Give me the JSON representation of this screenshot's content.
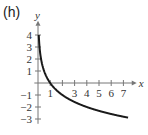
{
  "panel": {
    "label": "(h)"
  },
  "chart_data": {
    "type": "line",
    "title": "",
    "xlabel": "x",
    "ylabel": "y",
    "xlim": [
      0,
      7.6
    ],
    "ylim": [
      -3.4,
      4.6
    ],
    "x_ticks": [
      1,
      2,
      3,
      4,
      5,
      6,
      7
    ],
    "x_tick_labels": [
      "1",
      "",
      "3",
      "4",
      "5",
      "6",
      "7"
    ],
    "y_ticks": [
      -3,
      -2,
      -1,
      1,
      2,
      3,
      4
    ],
    "y_tick_labels": [
      "-3",
      "-2",
      "-1",
      "1",
      "2",
      "3",
      "4"
    ],
    "grid": false,
    "series": [
      {
        "name": "y = log_{1/2} x",
        "x": [
          0.0625,
          0.1,
          0.2,
          0.3,
          0.5,
          0.75,
          1,
          1.5,
          2,
          3,
          4,
          5,
          6,
          7,
          7.4
        ],
        "y": [
          4.0,
          3.32,
          2.32,
          1.74,
          1.0,
          0.42,
          0.0,
          -0.58,
          -1.0,
          -1.58,
          -2.0,
          -2.32,
          -2.58,
          -2.81,
          -2.89
        ]
      }
    ]
  }
}
